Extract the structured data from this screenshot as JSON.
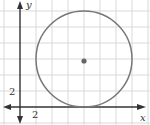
{
  "figure": {
    "axes": {
      "x_label": "x",
      "y_label": "y",
      "x_tick_label": "2",
      "y_tick_label": "2",
      "units_per_grid": 2
    },
    "circle": {
      "center": [
        8,
        6
      ],
      "radius": 6,
      "tangent_to": "x-axis"
    },
    "colors": {
      "grid": "#d9d9d9",
      "axis": "#333333",
      "circle": "#777777",
      "center_point": "#666666",
      "background": "#ffffff"
    }
  }
}
